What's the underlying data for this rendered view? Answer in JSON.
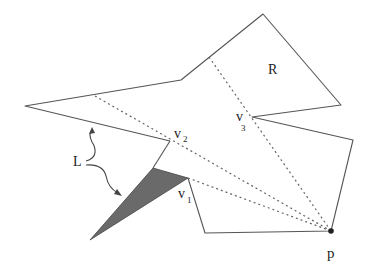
{
  "figure": {
    "labels": {
      "R": "R",
      "v2_main": "v",
      "v2_sub": "2",
      "v3_main": "v",
      "v3_sub": "3",
      "v1_main": "v",
      "v1_sub": "1",
      "L": "L",
      "p": "p"
    },
    "colors": {
      "edge": "#555555",
      "dashed": "#666666",
      "shaded_region": "#6a6a6a",
      "background": "#ffffff"
    },
    "polygon_vertices": [
      [
        25,
        106
      ],
      [
        181,
        80
      ],
      [
        263,
        14
      ],
      [
        341,
        105
      ],
      [
        252,
        117
      ],
      [
        353,
        140
      ],
      [
        331,
        231
      ],
      [
        205,
        233
      ],
      [
        188,
        178
      ],
      [
        170,
        141
      ]
    ],
    "point_p": [
      331,
      231
    ],
    "shaded_triangle": [
      [
        153,
        168
      ],
      [
        188,
        178
      ],
      [
        90,
        240
      ]
    ],
    "dashed_segments": [
      [
        [
          95,
          96
        ],
        [
          331,
          231
        ]
      ],
      [
        [
          209,
          57
        ],
        [
          331,
          231
        ]
      ],
      [
        [
          188,
          178
        ],
        [
          331,
          231
        ]
      ]
    ]
  }
}
